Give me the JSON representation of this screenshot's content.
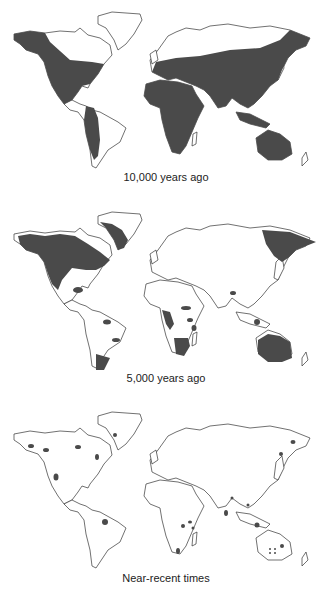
{
  "figure": {
    "panels": [
      {
        "caption": "10,000 years ago",
        "range_description": "Broad range across North America, Central & western South America, Africa, Europe, Asia, Southeast Asia, Australia"
      },
      {
        "caption": "5,000 years ago",
        "range_description": "Northern North America, Greenland, Northeast Asia, scattered patches in Africa, South America, Southeast Asia, Australia"
      },
      {
        "caption": "Near-recent times",
        "range_description": "Scattered isolated locations worldwide"
      }
    ],
    "colors": {
      "range": "#4a4a4a",
      "outline": "#333333",
      "background": "#ffffff"
    }
  }
}
